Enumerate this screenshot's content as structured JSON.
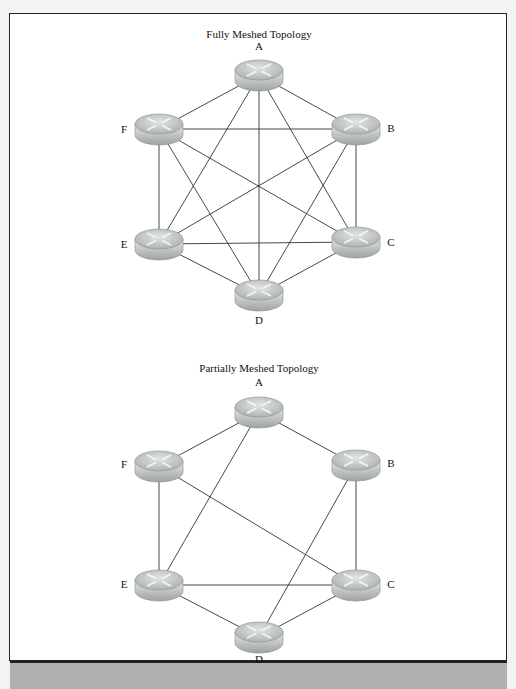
{
  "diagrams": [
    {
      "title": "Fully Meshed Topology",
      "nodes": [
        {
          "id": "A",
          "label": "A",
          "x": 259,
          "y": 75,
          "lx": 259,
          "ly": 50
        },
        {
          "id": "B",
          "label": "B",
          "x": 356,
          "y": 129,
          "lx": 391,
          "ly": 132
        },
        {
          "id": "C",
          "label": "C",
          "x": 356,
          "y": 242,
          "lx": 391,
          "ly": 246
        },
        {
          "id": "D",
          "label": "D",
          "x": 259,
          "y": 295,
          "lx": 259,
          "ly": 324
        },
        {
          "id": "E",
          "label": "E",
          "x": 159,
          "y": 244,
          "lx": 124,
          "ly": 248
        },
        {
          "id": "F",
          "label": "F",
          "x": 159,
          "y": 129,
          "lx": 124,
          "ly": 133
        }
      ],
      "edges": [
        [
          "A",
          "B"
        ],
        [
          "A",
          "C"
        ],
        [
          "A",
          "D"
        ],
        [
          "A",
          "E"
        ],
        [
          "A",
          "F"
        ],
        [
          "B",
          "C"
        ],
        [
          "B",
          "D"
        ],
        [
          "B",
          "E"
        ],
        [
          "B",
          "F"
        ],
        [
          "C",
          "D"
        ],
        [
          "C",
          "E"
        ],
        [
          "C",
          "F"
        ],
        [
          "D",
          "E"
        ],
        [
          "D",
          "F"
        ],
        [
          "E",
          "F"
        ]
      ]
    },
    {
      "title": "Partially Meshed Topology",
      "nodes": [
        {
          "id": "A",
          "label": "A",
          "x": 259,
          "y": 412,
          "lx": 259,
          "ly": 386
        },
        {
          "id": "B",
          "label": "B",
          "x": 356,
          "y": 465,
          "lx": 391,
          "ly": 467
        },
        {
          "id": "C",
          "label": "C",
          "x": 356,
          "y": 585,
          "lx": 391,
          "ly": 588
        },
        {
          "id": "D",
          "label": "D",
          "x": 259,
          "y": 637,
          "lx": 259,
          "ly": 663
        },
        {
          "id": "E",
          "label": "E",
          "x": 159,
          "y": 585,
          "lx": 124,
          "ly": 588
        },
        {
          "id": "F",
          "label": "F",
          "x": 159,
          "y": 466,
          "lx": 124,
          "ly": 468
        }
      ],
      "edges": [
        [
          "A",
          "F"
        ],
        [
          "A",
          "B"
        ],
        [
          "A",
          "E"
        ],
        [
          "F",
          "E"
        ],
        [
          "F",
          "C"
        ],
        [
          "B",
          "C"
        ],
        [
          "B",
          "D"
        ],
        [
          "E",
          "C"
        ],
        [
          "E",
          "D"
        ],
        [
          "C",
          "D"
        ]
      ]
    }
  ],
  "titles": {
    "full": "Fully Meshed Topology",
    "partial": "Partially Meshed Topology"
  },
  "colors": {
    "line": "#333333",
    "router_top": "#cfd3d3",
    "router_side": "#a9adad",
    "caption_bar": "#b0b0b0"
  }
}
